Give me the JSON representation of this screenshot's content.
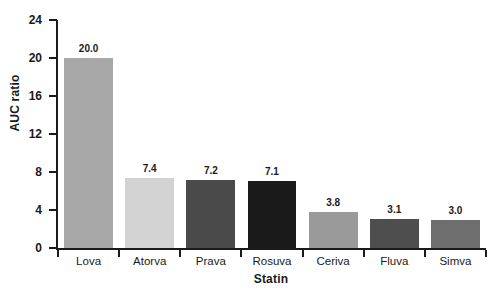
{
  "chart_data": {
    "type": "bar",
    "title": "",
    "xlabel": "Statin",
    "ylabel": "AUC ratio",
    "categories": [
      "Lova",
      "Atorva",
      "Prava",
      "Rosuva",
      "Ceriva",
      "Fluva",
      "Simva"
    ],
    "values": [
      20.0,
      7.4,
      7.2,
      7.1,
      3.8,
      3.1,
      3.0
    ],
    "value_labels": [
      "20.0",
      "7.4",
      "7.2",
      "7.1",
      "3.8",
      "3.1",
      "3.0"
    ],
    "bar_colors": [
      "#a8a8a8",
      "#d2d2d2",
      "#4a4a4a",
      "#1a1a1a",
      "#9a9a9a",
      "#4e4e4e",
      "#6e6e6e"
    ],
    "ylim": [
      0,
      24
    ],
    "yticks": [
      0,
      4,
      8,
      12,
      16,
      20,
      24
    ],
    "ytick_labels": [
      "0",
      "4",
      "8",
      "12",
      "16",
      "20",
      "24"
    ],
    "grid": false,
    "legend": false,
    "axis_color": "#1a1a1a",
    "background": "#ffffff"
  }
}
